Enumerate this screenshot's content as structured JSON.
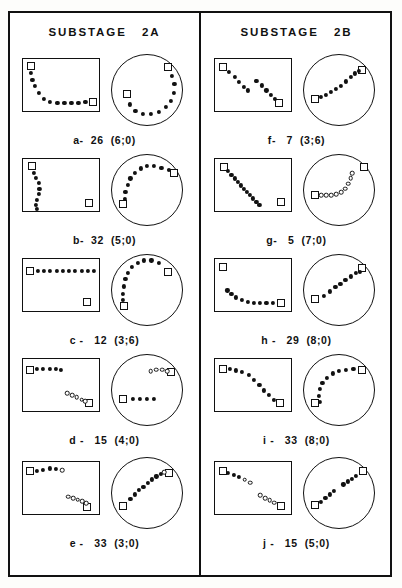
{
  "figure": {
    "width": 402,
    "height": 588,
    "background_color": "#ffffff",
    "ink_color": "#111111"
  },
  "columns": [
    {
      "title": "SUBSTAGE   2A",
      "id": "substage-2a"
    },
    {
      "title": "SUBSTAGE   2B",
      "id": "substage-2b"
    }
  ],
  "panels": {
    "a": {
      "label": "a-  26  (6;0)"
    },
    "b": {
      "label": "b-  32  (5;0)"
    },
    "c": {
      "label": "c -   12  (3;6)"
    },
    "d": {
      "label": "d -   15  (4;0)"
    },
    "e": {
      "label": "e -   33  (3;0)"
    },
    "f": {
      "label": "f-   7  (3;6)"
    },
    "g": {
      "label": "g-   5  (7;0)"
    },
    "h": {
      "label": "h -   29  (8;0)"
    },
    "i": {
      "label": "i -   33  (8;0)"
    },
    "j": {
      "label": "j -   15  (5;0)"
    }
  },
  "chart_data": {
    "type": "scatter",
    "legend": [
      {
        "name": "endpoint",
        "marker": "square-open"
      },
      {
        "name": "sample-filled",
        "marker": "dot-filled"
      },
      {
        "name": "sample-open",
        "marker": "dot-open"
      }
    ],
    "panels": [
      {
        "id": "a",
        "column": "SUBSTAGE 2A",
        "label": "a-  26  (6;0)",
        "rect": {
          "squares": [
            [
              10,
              13
            ],
            [
              90,
              80
            ]
          ],
          "filled": [
            [
              10,
              25
            ],
            [
              12,
              38
            ],
            [
              15,
              50
            ],
            [
              20,
              63
            ],
            [
              27,
              74
            ],
            [
              35,
              79
            ],
            [
              44,
              81
            ],
            [
              53,
              82
            ],
            [
              62,
              82
            ],
            [
              71,
              81
            ],
            [
              80,
              80
            ]
          ],
          "open": []
        },
        "circle": {
          "squares": [
            [
              79,
              18
            ],
            [
              22,
              56
            ]
          ],
          "filled": [
            [
              85,
              30
            ],
            [
              88,
              42
            ],
            [
              87,
              54
            ],
            [
              83,
              65
            ],
            [
              76,
              74
            ],
            [
              66,
              80
            ],
            [
              55,
              83
            ],
            [
              44,
              83
            ],
            [
              34,
              79
            ],
            [
              26,
              70
            ]
          ],
          "open": []
        }
      },
      {
        "id": "b",
        "column": "SUBSTAGE 2A",
        "label": "b-  32  (5;0)",
        "rect": {
          "squares": [
            [
              11,
              13
            ],
            [
              84,
              82
            ]
          ],
          "filled": [
            [
              14,
              25
            ],
            [
              17,
              35
            ],
            [
              20,
              45
            ],
            [
              21,
              55
            ],
            [
              20,
              65
            ],
            [
              18,
              75
            ],
            [
              17,
              85
            ],
            [
              18,
              92
            ]
          ],
          "open": []
        },
        "circle": {
          "squares": [
            [
              87,
              26
            ],
            [
              17,
              70
            ]
          ],
          "filled": [
            [
              80,
              22
            ],
            [
              70,
              19
            ],
            [
              60,
              17
            ],
            [
              50,
              17
            ],
            [
              41,
              20
            ],
            [
              33,
              26
            ],
            [
              27,
              34
            ],
            [
              23,
              43
            ],
            [
              20,
              53
            ],
            [
              19,
              62
            ]
          ],
          "open": []
        }
      },
      {
        "id": "c",
        "column": "SUBSTAGE 2A",
        "label": "c -   12  (3;6)",
        "rect": {
          "squares": [
            [
              9,
              22
            ],
            [
              82,
              80
            ]
          ],
          "filled": [
            [
              19,
              22
            ],
            [
              27,
              22
            ],
            [
              35,
              22
            ],
            [
              43,
              22
            ],
            [
              51,
              22
            ],
            [
              59,
              22
            ],
            [
              67,
              22
            ],
            [
              75,
              22
            ],
            [
              83,
              22
            ],
            [
              91,
              22
            ]
          ],
          "open": []
        },
        "circle": {
          "squares": [
            [
              79,
              25
            ],
            [
              18,
              72
            ]
          ],
          "filled": [
            [
              66,
              12
            ],
            [
              56,
              9
            ],
            [
              46,
              9
            ],
            [
              37,
              12
            ],
            [
              29,
              18
            ],
            [
              24,
              26
            ],
            [
              20,
              35
            ],
            [
              18,
              45
            ],
            [
              17,
              55
            ],
            [
              17,
              64
            ]
          ],
          "open": []
        }
      },
      {
        "id": "d",
        "column": "SUBSTAGE 2A",
        "label": "d -   15  (4;0)",
        "rect": {
          "squares": [
            [
              9,
              20
            ],
            [
              84,
              82
            ]
          ],
          "filled": [
            [
              18,
              19
            ],
            [
              26,
              18
            ],
            [
              34,
              18
            ],
            [
              42,
              19
            ],
            [
              49,
              20
            ]
          ],
          "open": [
            [
              57,
              63
            ],
            [
              63,
              67
            ],
            [
              69,
              71
            ],
            [
              75,
              75
            ],
            [
              80,
              78
            ]
          ]
        },
        "circle": {
          "squares": [
            [
              83,
              25
            ],
            [
              17,
              62
            ]
          ],
          "filled": [
            [
              30,
              62
            ],
            [
              40,
              62
            ],
            [
              50,
              62
            ],
            [
              60,
              62
            ]
          ],
          "open": [
            [
              55,
              24
            ],
            [
              63,
              22
            ],
            [
              71,
              22
            ],
            [
              78,
              24
            ]
          ]
        }
      },
      {
        "id": "e",
        "column": "SUBSTAGE 2A",
        "label": "e -   33  (3;0)",
        "rect": {
          "squares": [
            [
              9,
              17
            ],
            [
              82,
              84
            ]
          ],
          "filled": [
            [
              18,
              17
            ],
            [
              26,
              14
            ],
            [
              34,
              12
            ],
            [
              42,
              13
            ]
          ],
          "open": [
            [
              50,
              15
            ],
            [
              58,
              64
            ],
            [
              64,
              67
            ],
            [
              70,
              70
            ],
            [
              76,
              73
            ],
            [
              81,
              76
            ]
          ]
        },
        "circle": {
          "squares": [
            [
              80,
              22
            ],
            [
              17,
              68
            ]
          ],
          "filled": [
            [
              69,
              24
            ],
            [
              63,
              27
            ],
            [
              57,
              31
            ],
            [
              51,
              36
            ],
            [
              45,
              41
            ],
            [
              39,
              46
            ],
            [
              33,
              52
            ],
            [
              27,
              58
            ]
          ],
          "open": [
            [
              74,
              21
            ]
          ]
        }
      },
      {
        "id": "f",
        "column": "SUBSTAGE 2B",
        "label": "f-   7  (3;6)",
        "rect": {
          "squares": [
            [
              10,
              15
            ],
            [
              82,
              82
            ]
          ],
          "filled": [
            [
              18,
              24
            ],
            [
              25,
              33
            ],
            [
              31,
              42
            ],
            [
              37,
              51
            ],
            [
              42,
              58
            ],
            [
              53,
              40
            ],
            [
              60,
              49
            ],
            [
              66,
              58
            ],
            [
              72,
              67
            ],
            [
              77,
              74
            ]
          ],
          "open": []
        },
        "circle": {
          "squares": [
            [
              17,
              63
            ],
            [
              82,
              22
            ]
          ],
          "filled": [
            [
              25,
              60
            ],
            [
              32,
              57
            ],
            [
              39,
              53
            ],
            [
              46,
              49
            ],
            [
              53,
              44
            ],
            [
              60,
              38
            ],
            [
              66,
              32
            ],
            [
              72,
              27
            ],
            [
              78,
              23
            ]
          ],
          "open": []
        }
      },
      {
        "id": "g",
        "column": "SUBSTAGE 2B",
        "label": "g-   5  (7;0)",
        "rect": {
          "squares": [
            [
              11,
              15
            ],
            [
              84,
              80
            ]
          ],
          "filled": [
            [
              17,
              22
            ],
            [
              21,
              29
            ],
            [
              25,
              36
            ],
            [
              29,
              42
            ],
            [
              33,
              49
            ],
            [
              37,
              55
            ],
            [
              41,
              61
            ],
            [
              45,
              67
            ],
            [
              49,
              73
            ],
            [
              53,
              79
            ],
            [
              57,
              85
            ]
          ],
          "open": []
        },
        "circle": {
          "squares": [
            [
              17,
              57
            ],
            [
              85,
              18
            ]
          ],
          "filled": [],
          "open": [
            [
              25,
              57
            ],
            [
              32,
              57
            ],
            [
              39,
              57
            ],
            [
              46,
              56
            ],
            [
              53,
              53
            ],
            [
              59,
              48
            ],
            [
              63,
              41
            ],
            [
              66,
              34
            ],
            [
              68,
              27
            ]
          ]
        }
      },
      {
        "id": "h",
        "column": "SUBSTAGE 2B",
        "label": "h -   29  (8;0)",
        "rect": {
          "squares": [
            [
              10,
              15
            ],
            [
              84,
              82
            ]
          ],
          "filled": [
            [
              16,
              58
            ],
            [
              21,
              65
            ],
            [
              27,
              71
            ],
            [
              34,
              76
            ],
            [
              42,
              79
            ],
            [
              50,
              81
            ],
            [
              58,
              82
            ],
            [
              66,
              82
            ],
            [
              74,
              82
            ]
          ],
          "open": []
        },
        "circle": {
          "squares": [
            [
              17,
              62
            ],
            [
              82,
              20
            ]
          ],
          "filled": [
            [
              29,
              58
            ],
            [
              37,
              52
            ],
            [
              45,
              46
            ],
            [
              52,
              41
            ],
            [
              59,
              36
            ],
            [
              66,
              31
            ],
            [
              73,
              26
            ],
            [
              79,
              25
            ]
          ],
          "open": []
        }
      },
      {
        "id": "i",
        "column": "SUBSTAGE 2B",
        "label": "i -   33  (8;0)",
        "rect": {
          "squares": [
            [
              10,
              18
            ],
            [
              83,
              82
            ]
          ],
          "filled": [
            [
              19,
              19
            ],
            [
              27,
              21
            ],
            [
              35,
              24
            ],
            [
              43,
              30
            ],
            [
              50,
              38
            ],
            [
              57,
              48
            ],
            [
              63,
              58
            ],
            [
              69,
              67
            ],
            [
              75,
              75
            ]
          ],
          "open": []
        },
        "circle": {
          "squares": [
            [
              17,
              68
            ],
            [
              82,
              22
            ]
          ],
          "filled": [
            [
              24,
              66
            ],
            [
              22,
              58
            ],
            [
              23,
              49
            ],
            [
              27,
              40
            ],
            [
              33,
              33
            ],
            [
              41,
              27
            ],
            [
              50,
              24
            ],
            [
              60,
              22
            ],
            [
              70,
              21
            ]
          ],
          "open": []
        }
      },
      {
        "id": "j",
        "column": "SUBSTAGE 2B",
        "label": "j -   15  (5;0)",
        "rect": {
          "squares": [
            [
              10,
              16
            ],
            [
              84,
              82
            ]
          ],
          "filled": [
            [
              17,
              20
            ],
            [
              24,
              24
            ],
            [
              31,
              28
            ]
          ],
          "open": [
            [
              38,
              33
            ],
            [
              45,
              38
            ],
            [
              58,
              62
            ],
            [
              64,
              67
            ],
            [
              70,
              71
            ],
            [
              76,
              75
            ]
          ]
        },
        "circle": {
          "squares": [
            [
              17,
              66
            ],
            [
              83,
              20
            ]
          ],
          "filled": [
            [
              25,
              62
            ],
            [
              31,
              57
            ],
            [
              37,
              52
            ],
            [
              43,
              47
            ],
            [
              56,
              38
            ],
            [
              62,
              34
            ],
            [
              68,
              30
            ],
            [
              74,
              26
            ]
          ],
          "open": []
        }
      }
    ]
  }
}
